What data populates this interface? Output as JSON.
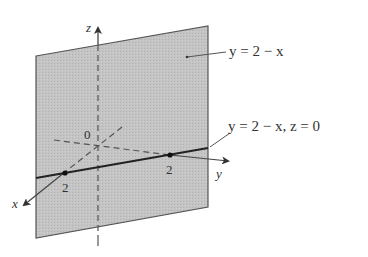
{
  "figure": {
    "type": "3d-plane-diagram",
    "axes": {
      "z_label": "z",
      "y_label": "y",
      "x_label": "x",
      "origin_label": "0"
    },
    "ticks": {
      "x_tick": "2",
      "y_tick": "2"
    },
    "annotations": {
      "plane_label": "y = 2 − x",
      "trace_label": "y = 2 − x, z = 0"
    },
    "colors": {
      "plane_fill": "#bdbdbd",
      "plane_edge": "#555555",
      "axis": "#444444",
      "trace_line": "#222222",
      "background": "#ffffff"
    }
  }
}
